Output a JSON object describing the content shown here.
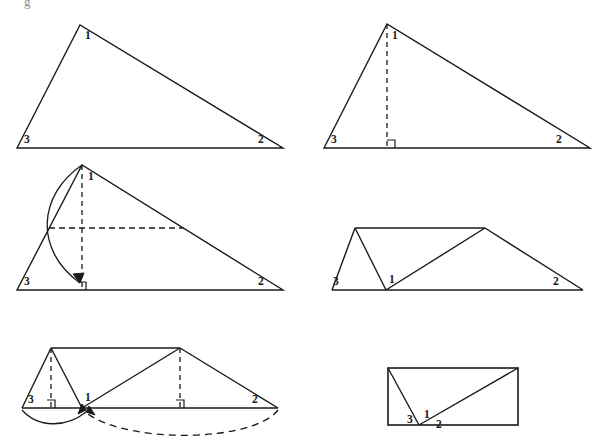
{
  "page": {
    "background_color": "#ffffff",
    "stroke_color": "#1a1a1a",
    "label_color": "#1a1a1a",
    "partial_top_glyph": "g"
  },
  "vertex_labels": {
    "one": "1",
    "two": "2",
    "three": "3"
  },
  "figures": [
    {
      "id": "figure-1",
      "name": "plain-triangle",
      "caption": "",
      "labels": [
        {
          "text": "1",
          "x": 85,
          "y": 39
        },
        {
          "text": "2",
          "x": 258,
          "y": 143
        },
        {
          "text": "3",
          "x": 24,
          "y": 143
        }
      ]
    },
    {
      "id": "figure-2",
      "name": "triangle-with-altitude",
      "caption": "",
      "labels": [
        {
          "text": "1",
          "x": 392,
          "y": 39
        },
        {
          "text": "2",
          "x": 556,
          "y": 143
        },
        {
          "text": "3",
          "x": 331,
          "y": 143
        }
      ]
    },
    {
      "id": "figure-3",
      "name": "triangle-with-midline-and-rotation-arc",
      "caption": "",
      "labels": [
        {
          "text": "1",
          "x": 88,
          "y": 180
        },
        {
          "text": "2",
          "x": 258,
          "y": 285
        },
        {
          "text": "3",
          "x": 24,
          "y": 285
        }
      ]
    },
    {
      "id": "figure-4",
      "name": "rearranged-parallelogram",
      "caption": "",
      "labels": [
        {
          "text": "1",
          "x": 389,
          "y": 283
        },
        {
          "text": "2",
          "x": 553,
          "y": 285
        },
        {
          "text": "3",
          "x": 333,
          "y": 285
        }
      ]
    },
    {
      "id": "figure-5",
      "name": "parallelogram-with-altitudes-and-arcs",
      "caption": "",
      "labels": [
        {
          "text": "1",
          "x": 85,
          "y": 401
        },
        {
          "text": "2",
          "x": 252,
          "y": 403
        },
        {
          "text": "3",
          "x": 28,
          "y": 403
        }
      ]
    },
    {
      "id": "figure-6",
      "name": "final-rectangle",
      "caption": "",
      "labels": [
        {
          "text": "1",
          "x": 424,
          "y": 418
        },
        {
          "text": "2",
          "x": 436,
          "y": 428
        },
        {
          "text": "3",
          "x": 407,
          "y": 423
        }
      ]
    }
  ]
}
